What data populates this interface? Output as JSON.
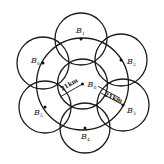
{
  "diagram": {
    "type": "cellular-coverage-layout",
    "stroke_color": "#1a1a1a",
    "background": "#ffffff",
    "center": {
      "label": "B",
      "sub": "0",
      "x": 82.5,
      "y": 84
    },
    "inner_circle": {
      "cx": 82.5,
      "cy": 84,
      "r": 25
    },
    "middle_circle": {
      "cx": 82.5,
      "cy": 84,
      "r": 46
    },
    "outer_circles": [
      {
        "id": "B1",
        "label": "B",
        "sub": "1",
        "cx": 81,
        "cy": 39,
        "r": 26,
        "label_x": 76,
        "label_y": 33
      },
      {
        "id": "B2",
        "label": "B",
        "sub": "2",
        "cx": 121,
        "cy": 60,
        "r": 26,
        "label_x": 127,
        "label_y": 64
      },
      {
        "id": "B3",
        "label": "B",
        "sub": "3",
        "cx": 123,
        "cy": 105,
        "r": 26,
        "label_x": 127,
        "label_y": 113
      },
      {
        "id": "B4",
        "label": "B",
        "sub": "4",
        "cx": 85,
        "cy": 128,
        "r": 25,
        "label_x": 81,
        "label_y": 139
      },
      {
        "id": "B5",
        "label": "B",
        "sub": "5",
        "cx": 45,
        "cy": 107,
        "r": 26,
        "label_x": 34,
        "label_y": 115
      },
      {
        "id": "B6",
        "label": "B",
        "sub": "6",
        "cx": 43,
        "cy": 63,
        "r": 26,
        "label_x": 31,
        "label_y": 63
      }
    ],
    "dimensions": [
      {
        "id": "left-radius",
        "text": "21km",
        "x1": 82.5,
        "y1": 84,
        "x2": 60,
        "y2": 97,
        "text_x": 62,
        "text_y": 91,
        "angle": -30
      },
      {
        "id": "right-radius",
        "text": "21km",
        "x1": 101,
        "y1": 93,
        "x2": 123,
        "y2": 105,
        "text_x": 104,
        "text_y": 96,
        "angle": 22
      }
    ]
  }
}
